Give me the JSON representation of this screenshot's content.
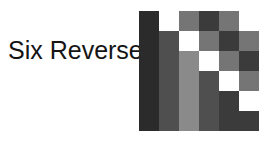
{
  "figure": {
    "label": "Six Reverse",
    "label_color": "#141414",
    "background": "#ffffff"
  },
  "palette": {
    "white": "#ffffff",
    "light_gray": "#8a8a8a",
    "medium_gray": "#757575",
    "medium_dark_gray": "#4f4f4f",
    "dark_gray": "#3b3b3b",
    "darkest": "#2b2b2b",
    "grid_line": "#6b6b6b"
  },
  "chart_data": {
    "type": "heatmap",
    "title": "Six Reverse",
    "rows": 6,
    "cols": 6,
    "xlabel": "",
    "ylabel": "",
    "grid": [
      [
        "darkest",
        "white",
        "medium_gray",
        "dark_gray",
        "medium_gray",
        "white"
      ],
      [
        "darkest",
        "medium_dark_gray",
        "white",
        "medium_gray",
        "dark_gray",
        "medium_gray"
      ],
      [
        "darkest",
        "medium_dark_gray",
        "light_gray",
        "white",
        "medium_gray",
        "dark_gray"
      ],
      [
        "darkest",
        "medium_dark_gray",
        "light_gray",
        "medium_dark_gray",
        "white",
        "medium_gray"
      ],
      [
        "darkest",
        "medium_dark_gray",
        "light_gray",
        "medium_dark_gray",
        "dark_gray",
        "white"
      ],
      [
        "darkest",
        "medium_dark_gray",
        "light_gray",
        "medium_dark_gray",
        "dark_gray",
        "dark_gray"
      ]
    ]
  }
}
